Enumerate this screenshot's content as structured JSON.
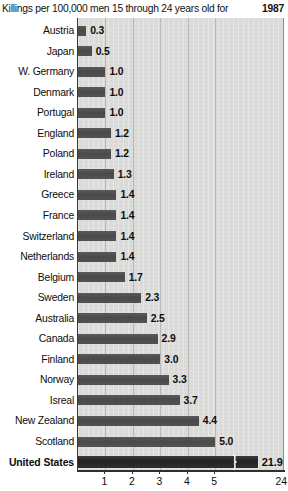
{
  "chart_data": {
    "type": "bar",
    "orientation": "horizontal",
    "title": "Killings per 100,000 men 15 through 24 years old for",
    "year": "1987",
    "xlabel": "",
    "ylabel": "",
    "xlim": [
      0,
      5.6
    ],
    "grid": "vertical gridlines at each tick",
    "legend": "none",
    "note": "x-axis is broken: the United States bar is truncated with a break mark and labelled 24 at the right edge",
    "xticks": [
      "1",
      "2",
      "3",
      "4",
      "5",
      "24"
    ],
    "xtick_positions": [
      1,
      2,
      3,
      4,
      5,
      5.59
    ],
    "categories": [
      "Austria",
      "Japan",
      "W. Germany",
      "Denmark",
      "Portugal",
      "England",
      "Poland",
      "Ireland",
      "Greece",
      "France",
      "Switzerland",
      "Netherlands",
      "Belgium",
      "Sweden",
      "Australia",
      "Canada",
      "Finland",
      "Norway",
      "Isreal",
      "New Zealand",
      "Scotland",
      "United States"
    ],
    "values": [
      0.3,
      0.5,
      1.0,
      1.0,
      1.0,
      1.2,
      1.2,
      1.3,
      1.4,
      1.4,
      1.4,
      1.4,
      1.7,
      2.3,
      2.5,
      2.9,
      3.0,
      3.3,
      3.7,
      4.4,
      5.0,
      21.9
    ],
    "value_labels": [
      "0.3",
      "0.5",
      "1.0",
      "1.0",
      "1.0",
      "1.2",
      "1.2",
      "1.3",
      "1.4",
      "1.4",
      "1.4",
      "1.4",
      "1.7",
      "2.3",
      "2.5",
      "2.9",
      "3.0",
      "3.3",
      "3.7",
      "4.4",
      "5.0",
      "21.9"
    ],
    "highlight_category": "United States",
    "colors": {
      "bar": "#4e4e4e",
      "highlight_bar": "#2b2b2b",
      "plot_background": "#dcdcdb",
      "gridline": "#b9b9b7",
      "axis": "#2f2f2f",
      "text": "#0d0d0d",
      "page_background": "#ffffff"
    }
  }
}
